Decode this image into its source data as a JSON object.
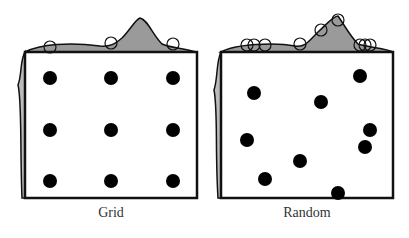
{
  "panels": [
    {
      "caption": "Grid",
      "box": {
        "x": 25,
        "y": 52,
        "w": 172,
        "h": 146
      },
      "points": [
        [
          50,
          78
        ],
        [
          111,
          78
        ],
        [
          173,
          78
        ],
        [
          50,
          130
        ],
        [
          111,
          130
        ],
        [
          173,
          130
        ],
        [
          50,
          181
        ],
        [
          111,
          181
        ],
        [
          173,
          181
        ]
      ],
      "top_marks": [
        50,
        111,
        173
      ]
    },
    {
      "caption": "Random",
      "box": {
        "x": 221,
        "y": 52,
        "w": 172,
        "h": 146
      },
      "points": [
        [
          254,
          93
        ],
        [
          321,
          102
        ],
        [
          360,
          76
        ],
        [
          247,
          140
        ],
        [
          370,
          130
        ],
        [
          365,
          147
        ],
        [
          300,
          161
        ],
        [
          265,
          179
        ],
        [
          338,
          193
        ]
      ],
      "top_marks": [
        247,
        254,
        265,
        300,
        321,
        338,
        360,
        365,
        370
      ]
    }
  ],
  "colors": {
    "fill": "#9a9a9a",
    "point": "#000000",
    "stroke": "#111111"
  }
}
